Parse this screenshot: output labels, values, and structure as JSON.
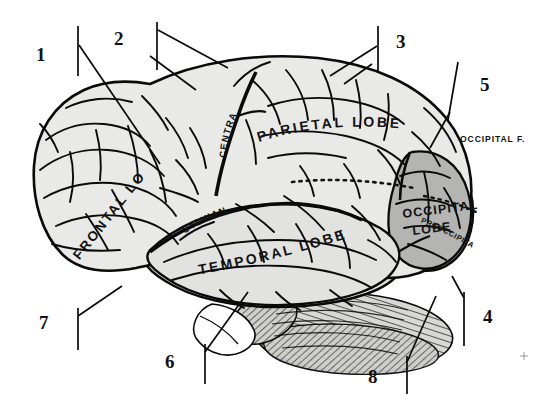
{
  "figure": {
    "view": "left lateral",
    "colors": {
      "background": "#ffffff",
      "cortex_fill": "#e9e9e7",
      "occipital_fill": "#b4b4b2",
      "temporal_fill": "#dedede",
      "cerebellum_fill": "#d6d6d4",
      "outline": "#0a0a0a",
      "text": "#111111"
    }
  },
  "region_labels": [
    {
      "id": "frontal-lobe",
      "text": "FRONTAL LOBE"
    },
    {
      "id": "parietal-lobe",
      "text": "PARIETAL LOBE"
    },
    {
      "id": "temporal-lobe",
      "text": "TEMPORAL LOBE"
    },
    {
      "id": "occipital-lobe-1",
      "text": "OCCIPITAL"
    },
    {
      "id": "occipital-lobe-2",
      "text": "LOBE"
    },
    {
      "id": "central-fissure",
      "text": "CENTRAL F."
    },
    {
      "id": "sylvian-fissure",
      "text": "SYLVIAN F."
    },
    {
      "id": "occipital-fissure",
      "text": "OCCIPITAL F."
    },
    {
      "id": "preoccipital-notch",
      "text": "PREOCCIPITAL NOTCH"
    }
  ],
  "callouts": [
    {
      "id": "callout-1",
      "number": "1",
      "x": 36,
      "y": 45
    },
    {
      "id": "callout-2",
      "number": "2",
      "x": 114,
      "y": 29
    },
    {
      "id": "callout-3",
      "number": "3",
      "x": 396,
      "y": 32
    },
    {
      "id": "callout-4",
      "number": "4",
      "x": 483,
      "y": 307
    },
    {
      "id": "callout-5",
      "number": "5",
      "x": 480,
      "y": 75
    },
    {
      "id": "callout-6",
      "number": "6",
      "x": 165,
      "y": 352
    },
    {
      "id": "callout-7",
      "number": "7",
      "x": 39,
      "y": 313
    },
    {
      "id": "callout-8",
      "number": "8",
      "x": 368,
      "y": 367
    }
  ]
}
